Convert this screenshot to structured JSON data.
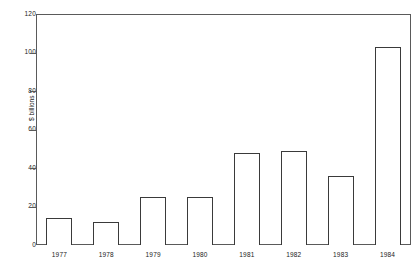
{
  "chart_data": {
    "type": "bar",
    "title": "",
    "subtitle": "",
    "xlabel": "",
    "ylabel": "$ billions",
    "categories": [
      "1977",
      "1978",
      "1979",
      "1980",
      "1981",
      "1982",
      "1983",
      "1984"
    ],
    "values": [
      14,
      12,
      25,
      25,
      48,
      49,
      36,
      103
    ],
    "ylim": [
      0,
      120
    ],
    "ytick_labels": [
      "0",
      "20",
      "40",
      "60",
      "80",
      "100",
      "120"
    ],
    "ytick_values": [
      0,
      20,
      40,
      60,
      80,
      100,
      120
    ],
    "grid": false,
    "legend": null,
    "legend_position": "none",
    "series": [
      {
        "name": "$ billions",
        "values": [
          14,
          12,
          25,
          25,
          48,
          49,
          36,
          103
        ]
      }
    ],
    "style": {
      "bar_fill": "#ffffff",
      "bar_edge": "#3a3a3a",
      "frame_color": "#5a5a5a",
      "text_color": "#1a1a1a",
      "background": "#ffffff"
    }
  }
}
